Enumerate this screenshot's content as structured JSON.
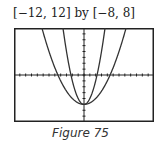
{
  "header": {
    "window": "[−12, 12] by [−8, 8]"
  },
  "caption": "Figure 75",
  "chart_data": {
    "type": "line",
    "title": "[−12, 12] by [−8, 8]",
    "xlabel": "",
    "ylabel": "",
    "xlim": [
      -12,
      12
    ],
    "ylim": [
      -8,
      8
    ],
    "grid": false,
    "tick_spacing": 1,
    "series": [
      {
        "name": "y = x^2 - 5",
        "x": [
          -3.6,
          -3,
          -2,
          -1,
          0,
          1,
          2,
          3,
          3.6
        ],
        "y": [
          7.96,
          4,
          -1,
          -4,
          -5,
          -4,
          -1,
          4,
          7.96
        ]
      },
      {
        "name": "y = x^2/4 - 5",
        "x": [
          -7.2,
          -6,
          -4,
          -2,
          0,
          2,
          4,
          6,
          7.2
        ],
        "y": [
          7.96,
          4,
          -1,
          -4,
          -5,
          -4,
          -1,
          4,
          7.96
        ]
      }
    ],
    "annotations": [
      "Figure 75"
    ]
  }
}
